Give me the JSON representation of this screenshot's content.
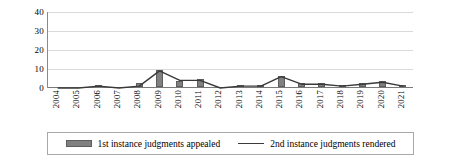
{
  "chart_data": {
    "type": "bar",
    "title": "",
    "subtitle": "",
    "xlabel": "",
    "ylabel": "",
    "ylim": [
      0,
      40
    ],
    "yticks": [
      0,
      10,
      20,
      30,
      40
    ],
    "grid": true,
    "legend_position": "bottom",
    "categories": [
      "2004",
      "2005",
      "2006",
      "2007",
      "2008",
      "2009",
      "2010",
      "2011",
      "2012",
      "2013",
      "2014",
      "2015",
      "2016",
      "2017",
      "2018",
      "2019",
      "2020",
      "2021"
    ],
    "series": [
      {
        "name": "1st instance judgments appealed",
        "type": "bar",
        "color": "#808080",
        "values": [
          0,
          0,
          1,
          0,
          2,
          9,
          3,
          4,
          0,
          1,
          1,
          6,
          2,
          2,
          1,
          2,
          3,
          1
        ]
      },
      {
        "name": "2nd instance judgments rendered",
        "type": "line",
        "color": "#3a3a3a",
        "values": [
          0,
          0,
          1,
          0,
          1,
          9,
          4,
          4,
          0,
          1,
          1,
          6,
          2,
          2,
          1,
          2,
          3,
          1
        ]
      }
    ]
  },
  "legend": {
    "items": [
      {
        "label": "1st instance judgments appealed",
        "marker": "bar-swatch"
      },
      {
        "label": "2nd instance judgments rendered",
        "marker": "line-swatch"
      }
    ]
  },
  "axes": {
    "y_tick_labels": [
      "0",
      "10",
      "20",
      "30",
      "40"
    ],
    "x_tick_labels": [
      "2004",
      "2005",
      "2006",
      "2007",
      "2008",
      "2009",
      "2010",
      "2011",
      "2012",
      "2013",
      "2014",
      "2015",
      "2016",
      "2017",
      "2018",
      "2019",
      "2020",
      "2021"
    ]
  },
  "colors": {
    "bar_fill": "#808080",
    "bar_stroke": "#5d5d5d",
    "line": "#3a3a3a",
    "gridline": "#d9d9d9",
    "axis": "#7a7a7a",
    "legend_border": "#a8a8a8",
    "background": "#ffffff"
  }
}
